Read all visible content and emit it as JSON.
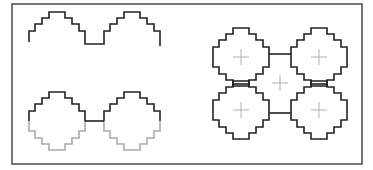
{
  "diagram": {
    "frame": {
      "x": 12,
      "y": 4,
      "width": 350,
      "height": 160,
      "stroke": "#555555"
    },
    "colors": {
      "line": "#222222",
      "faint_line": "#aaaaaa",
      "cross": "#b0b0b0",
      "background": "#ffffff"
    },
    "panels": [
      {
        "id": "wave",
        "description": "Stepped wave (upper halves of two tiles joined at trough)",
        "tiles": [
          {
            "cx": 57,
            "cy": 45
          },
          {
            "cx": 132,
            "cy": 45
          }
        ],
        "half": "upper"
      },
      {
        "id": "pair",
        "description": "Two stepped tiles: upper halves dark, lower halves faint",
        "tiles": [
          {
            "cx": 57,
            "cy": 121
          },
          {
            "cx": 132,
            "cy": 121
          }
        ],
        "connector_y": 121
      },
      {
        "id": "cluster",
        "description": "Five-cell arrangement of stepped tiles with center crosses",
        "tiles": [
          {
            "cx": 241,
            "cy": 57
          },
          {
            "cx": 319,
            "cy": 57
          },
          {
            "cx": 241,
            "cy": 110
          },
          {
            "cx": 319,
            "cy": 110
          }
        ],
        "crosses": [
          {
            "cx": 241,
            "cy": 57
          },
          {
            "cx": 319,
            "cy": 57
          },
          {
            "cx": 280,
            "cy": 83
          },
          {
            "cx": 241,
            "cy": 110
          },
          {
            "cx": 319,
            "cy": 110
          }
        ]
      }
    ]
  }
}
